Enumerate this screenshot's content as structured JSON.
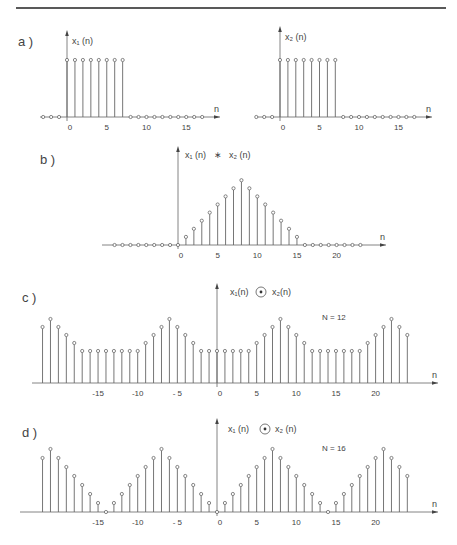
{
  "header": {
    "rule_color": "#222222"
  },
  "style": {
    "stroke": "#666666",
    "text": "#444444"
  },
  "panels": {
    "a": {
      "label": "a )",
      "left": {
        "title": "x₁ (n)",
        "axis_label": "n",
        "ticks": [
          "0",
          "5",
          "10",
          "15"
        ]
      },
      "right": {
        "title": "x₂ (n)",
        "axis_label": "n",
        "ticks": [
          "0",
          "5",
          "10",
          "15"
        ]
      }
    },
    "b": {
      "label": "b )",
      "title": "x₁ (n)   ∗   x₂ (n)",
      "axis_label": "n",
      "ticks": [
        "0",
        "5",
        "10",
        "15",
        "20"
      ]
    },
    "c": {
      "label": "c )",
      "title": "x₁(n)",
      "op": "⊛",
      "title2": "x₂(n)",
      "note": "N = 12",
      "axis_label": "n",
      "ticks": [
        "-15",
        "-10",
        "- 5",
        "0",
        "5",
        "10",
        "15",
        "20"
      ]
    },
    "d": {
      "label": "d )",
      "title": "x₁ (n)",
      "op": "⊛",
      "title2": "x₂ (n)",
      "note": "N = 16",
      "axis_label": "n",
      "ticks": [
        "-15",
        "-10",
        "- 5",
        "0",
        "5",
        "10",
        "15",
        "20"
      ]
    }
  },
  "chart_data": [
    {
      "type": "stem",
      "title": "x1(n)",
      "xlabel": "n",
      "x": [
        -3,
        -2,
        -1,
        0,
        1,
        2,
        3,
        4,
        5,
        6,
        7,
        8,
        9,
        10,
        11,
        12,
        13,
        14,
        15,
        16,
        17
      ],
      "values": [
        0,
        0,
        0,
        1,
        1,
        1,
        1,
        1,
        1,
        1,
        1,
        0,
        0,
        0,
        0,
        0,
        0,
        0,
        0,
        0,
        0
      ]
    },
    {
      "type": "stem",
      "title": "x2(n)",
      "xlabel": "n",
      "x": [
        -3,
        -2,
        -1,
        0,
        1,
        2,
        3,
        4,
        5,
        6,
        7,
        8,
        9,
        10,
        11,
        12,
        13,
        14,
        15,
        16,
        17
      ],
      "values": [
        0,
        0,
        0,
        1,
        1,
        1,
        1,
        1,
        1,
        1,
        1,
        0,
        0,
        0,
        0,
        0,
        0,
        0,
        0,
        0,
        0
      ]
    },
    {
      "type": "stem",
      "title": "x1(n) * x2(n)",
      "xlabel": "n",
      "x": [
        -8,
        -7,
        -6,
        -5,
        -4,
        -3,
        -2,
        -1,
        0,
        1,
        2,
        3,
        4,
        5,
        6,
        7,
        8,
        9,
        10,
        11,
        12,
        13,
        14,
        15,
        16,
        17,
        18,
        19,
        20,
        21,
        22,
        23
      ],
      "values": [
        0,
        0,
        0,
        0,
        0,
        0,
        0,
        0,
        0,
        1,
        2,
        3,
        4,
        5,
        6,
        7,
        8,
        7,
        6,
        5,
        4,
        3,
        2,
        1,
        0,
        0,
        0,
        0,
        0,
        0,
        0,
        0
      ]
    },
    {
      "type": "stem",
      "title": "x1(n) (*) x2(n)",
      "subtitle": "N = 12",
      "xlabel": "n",
      "x": [
        -22,
        -21,
        -20,
        -19,
        -18,
        -17,
        -16,
        -15,
        -14,
        -13,
        -12,
        -11,
        -10,
        -9,
        -8,
        -7,
        -6,
        -5,
        -4,
        -3,
        -2,
        -1,
        0,
        1,
        2,
        3,
        4,
        5,
        6,
        7,
        8,
        9,
        10,
        11,
        12,
        13,
        14,
        15,
        16,
        17,
        18,
        19,
        20,
        21,
        22,
        23,
        24
      ],
      "values": [
        7,
        8,
        7,
        6,
        5,
        4,
        4,
        4,
        4,
        4,
        4,
        4,
        4,
        5,
        6,
        7,
        8,
        7,
        6,
        5,
        4,
        4,
        4,
        4,
        4,
        4,
        4,
        5,
        6,
        7,
        8,
        7,
        6,
        5,
        4,
        4,
        4,
        4,
        4,
        4,
        4,
        5,
        6,
        7,
        8,
        7,
        6,
        5
      ]
    },
    {
      "type": "stem",
      "title": "x1(n) (*) x2(n)",
      "subtitle": "N = 16",
      "xlabel": "n",
      "x": [
        -22,
        -21,
        -20,
        -19,
        -18,
        -17,
        -16,
        -15,
        -14,
        -13,
        -12,
        -11,
        -10,
        -9,
        -8,
        -7,
        -6,
        -5,
        -4,
        -3,
        -2,
        -1,
        0,
        1,
        2,
        3,
        4,
        5,
        6,
        7,
        8,
        9,
        10,
        11,
        12,
        13,
        14,
        15,
        16,
        17,
        18,
        19,
        20,
        21,
        22,
        23,
        24
      ],
      "values": [
        6,
        7,
        6,
        5,
        4,
        3,
        2,
        1,
        0,
        1,
        2,
        3,
        4,
        5,
        6,
        7,
        6,
        5,
        4,
        3,
        2,
        1,
        0,
        1,
        2,
        3,
        4,
        5,
        6,
        7,
        6,
        5,
        4,
        3,
        2,
        1,
        0,
        1,
        2,
        3,
        4,
        5,
        6,
        7,
        6,
        5,
        4
      ]
    }
  ]
}
